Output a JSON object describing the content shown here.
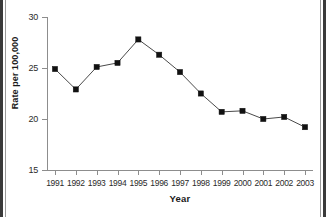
{
  "chart_data": {
    "type": "line",
    "title": "",
    "subtitle": "",
    "xlabel": "Year",
    "ylabel": "Rate per 100,000",
    "x": [
      1991,
      1992,
      1993,
      1994,
      1995,
      1996,
      1997,
      1998,
      1999,
      2000,
      2001,
      2002,
      2003
    ],
    "categories": [
      "1991",
      "1992",
      "1993",
      "1994",
      "1995",
      "1996",
      "1997",
      "1998",
      "1999",
      "2000",
      "2001",
      "2002",
      "2003"
    ],
    "values": [
      24.9,
      22.9,
      25.1,
      25.5,
      27.8,
      26.3,
      24.6,
      22.5,
      20.7,
      20.8,
      20.0,
      20.2,
      19.2
    ],
    "series": [
      {
        "name": "Rate per 100,000",
        "values": [
          24.9,
          22.9,
          25.1,
          25.5,
          27.8,
          26.3,
          24.6,
          22.5,
          20.7,
          20.8,
          20.0,
          20.2,
          19.2
        ]
      }
    ],
    "ylim": [
      15,
      30
    ],
    "yticks": [
      15,
      20,
      25,
      30
    ],
    "ytick_labels": [
      "15",
      "20",
      "25",
      "30"
    ],
    "xlim": [
      1990.5,
      2003.5
    ],
    "grid": false,
    "legend": false,
    "legend_position": "none",
    "marker": "square",
    "line_color": "#4a4a4a",
    "marker_color": "#111111",
    "background_color": "#ffffff",
    "axis_color": "#8d8d8d",
    "text_color": "#2b2b2b"
  },
  "figure": {
    "x_axis_title": "Year",
    "y_axis_title": "Rate per 100,000"
  }
}
